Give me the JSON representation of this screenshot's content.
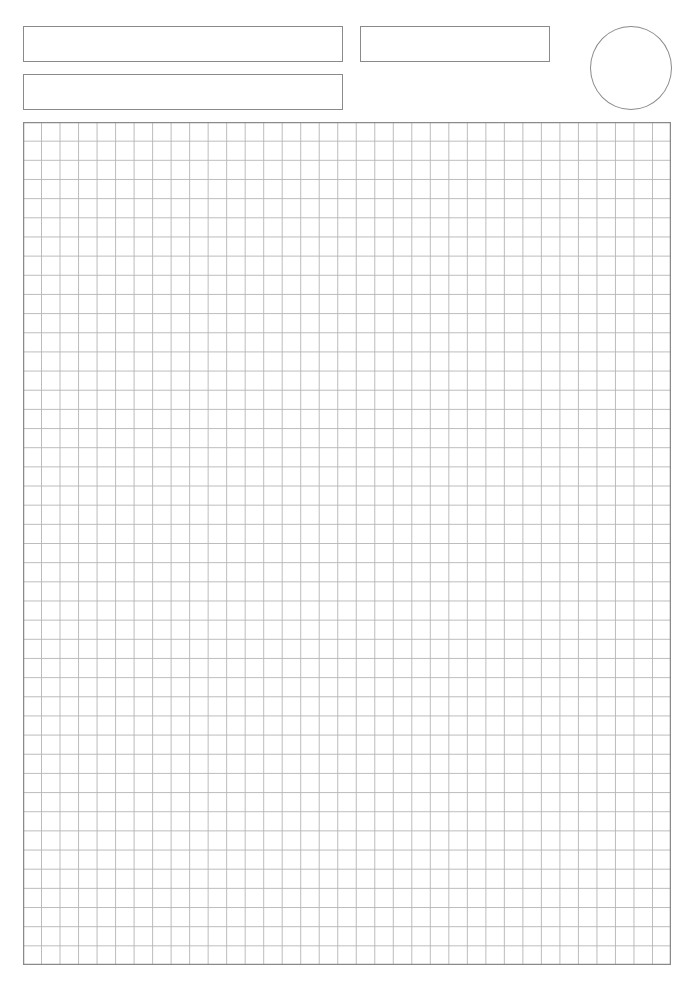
{
  "page": {
    "type": "graph-paper-worksheet",
    "background": "#ffffff",
    "line_color": "#8a8a8a",
    "grid_line_color": "#b5b5b5"
  },
  "header": {
    "fields": [
      {
        "id": "field-top-left",
        "label": "",
        "value": ""
      },
      {
        "id": "field-top-right",
        "label": "",
        "value": ""
      },
      {
        "id": "field-second-left",
        "label": "",
        "value": ""
      }
    ],
    "circle": {
      "label": "",
      "value": ""
    }
  },
  "grid": {
    "columns": 35,
    "rows": 44
  }
}
